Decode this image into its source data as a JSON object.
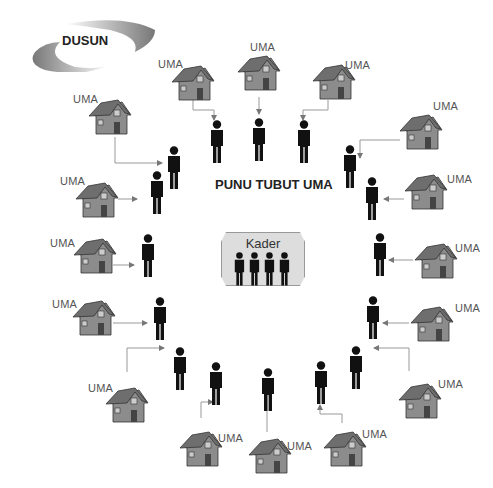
{
  "diagram": {
    "region_label": "DUSUN",
    "center_title": "PUNU TUBUT UMA",
    "kader_label": "Kader",
    "house_label": "UMA",
    "house_count": 18,
    "person_count": 18,
    "kader_person_count": 4,
    "colors": {
      "person": "#111111",
      "house_wall": "#8c8c8c",
      "house_roof": "#6e6e6e",
      "arrow": "#888888",
      "kader_bg": "#dddddd"
    }
  }
}
